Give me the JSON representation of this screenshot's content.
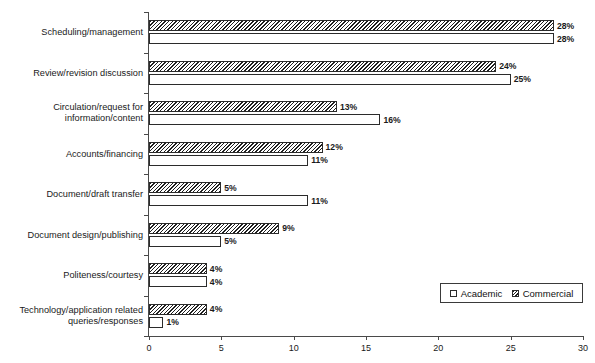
{
  "chart_data": {
    "type": "bar",
    "orientation": "horizontal",
    "title": "",
    "xlabel": "",
    "ylabel": "",
    "xlim": [
      0,
      30
    ],
    "xticks": [
      "0",
      "5",
      "10",
      "15",
      "20",
      "25",
      "30"
    ],
    "grid": false,
    "legend_position": "bottom-right",
    "categories": [
      "Scheduling/management",
      "Review/revision discussion",
      "Circulation/request for information/content",
      "Accounts/financing",
      "Document/draft transfer",
      "Document design/publishing",
      "Politeness/courtesy",
      "Technology/application related queries/responses"
    ],
    "category_lines": [
      [
        "Scheduling/management"
      ],
      [
        "Review/revision discussion"
      ],
      [
        "Circulation/request for",
        "information/content"
      ],
      [
        "Accounts/financing"
      ],
      [
        "Document/draft transfer"
      ],
      [
        "Document design/publishing"
      ],
      [
        "Politeness/courtesy"
      ],
      [
        "Technology/application related",
        "queries/responses"
      ]
    ],
    "series": [
      {
        "name": "Commercial",
        "pattern": "hatched",
        "values": [
          28,
          24,
          13,
          12,
          5,
          9,
          4,
          4
        ],
        "labels": [
          "28%",
          "24%",
          "13%",
          "12%",
          "5%",
          "9%",
          "4%",
          "4%"
        ]
      },
      {
        "name": "Academic",
        "pattern": "solid-white",
        "values": [
          28,
          25,
          16,
          11,
          11,
          5,
          4,
          1
        ],
        "labels": [
          "28%",
          "25%",
          "16%",
          "11%",
          "11%",
          "5%",
          "4%",
          "1%"
        ]
      }
    ]
  },
  "legend": {
    "items": [
      {
        "label": "Academic",
        "swatch": "academic"
      },
      {
        "label": "Commercial",
        "swatch": "commercial"
      }
    ]
  }
}
